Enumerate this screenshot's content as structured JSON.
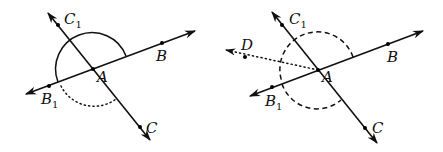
{
  "figures": [
    {
      "id": "left",
      "description": "Lines BB1 and CC1 intersecting at A; solid semicircular arc above line BB1 (angle B A B1 as a straight angle), dotted arc below between B1 and C.",
      "points": {
        "A": {
          "label": "A"
        },
        "B": {
          "label": "B"
        },
        "B1": {
          "label": "B",
          "sub": "1"
        },
        "C": {
          "label": "C"
        },
        "C1": {
          "label": "C",
          "sub": "1"
        }
      },
      "arcs": [
        {
          "style": "solid",
          "from": "B",
          "to": "B1",
          "side": "upper"
        },
        {
          "style": "dotted",
          "from": "B1",
          "to": "C",
          "side": "lower"
        }
      ]
    },
    {
      "id": "right",
      "description": "Same intersecting lines with an extra dotted ray AD; dashed arcs above (B to B1 through C1) and below (B1 to C).",
      "points": {
        "A": {
          "label": "A"
        },
        "B": {
          "label": "B"
        },
        "B1": {
          "label": "B",
          "sub": "1"
        },
        "C": {
          "label": "C"
        },
        "C1": {
          "label": "C",
          "sub": "1"
        },
        "D": {
          "label": "D"
        }
      },
      "arcs": [
        {
          "style": "dashed",
          "from": "B",
          "to": "B1",
          "side": "upper"
        },
        {
          "style": "dashed",
          "from": "B1",
          "to": "C",
          "side": "lower"
        }
      ],
      "ray": {
        "style": "dotted",
        "from": "A",
        "through": "D"
      }
    }
  ]
}
